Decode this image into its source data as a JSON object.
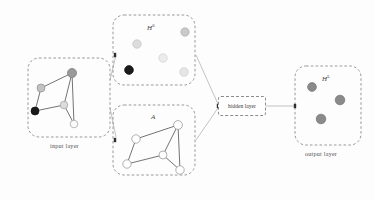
{
  "diagram": {
    "type": "flow-diagram",
    "canvas": {
      "width": 374,
      "height": 200,
      "background": "#fdfdfd"
    }
  },
  "palette": {
    "dashed_border": "#8c8c8c",
    "connector_line": "#b4b4b4",
    "graph_edge": "#5a5a5a",
    "node_black": "#1a1a1a",
    "node_dark_gray": "#9a9a9a",
    "node_mid_gray": "#b9b9b9",
    "node_light_gray": "#d8d8d8",
    "node_white": "#ffffff",
    "node_outline": "#9e9e9e",
    "output_node": "#8a8a8a",
    "text": "#4a4a4a"
  },
  "boxes": {
    "input_layer": {
      "caption": "input layer",
      "x": 28,
      "y": 58,
      "width": 82,
      "height": 79,
      "caption_x": 50,
      "caption_y": 142
    },
    "features": {
      "label": "H",
      "label_sup": "0",
      "x": 113,
      "y": 15,
      "width": 82,
      "height": 70,
      "label_x": 147,
      "label_y": 23
    },
    "adjacency": {
      "label": "A",
      "label_sup": "",
      "x": 113,
      "y": 105,
      "width": 82,
      "height": 70,
      "label_x": 151,
      "label_y": 113
    },
    "hidden_layer": {
      "label": "hidden layer",
      "x": 218,
      "y": 96,
      "width": 48,
      "height": 20
    },
    "output_layer": {
      "label": "H",
      "label_sup": "L",
      "caption": "output layer",
      "x": 295,
      "y": 66,
      "width": 66,
      "height": 79,
      "label_x": 322,
      "label_y": 74,
      "caption_x": 305,
      "caption_y": 150
    }
  },
  "input_graph": {
    "nodes": [
      {
        "id": "n1",
        "cx": 72,
        "cy": 73,
        "r": 4.6,
        "fill": "#9a9a9a",
        "stroke": "#7d7d7d"
      },
      {
        "id": "n2",
        "cx": 41,
        "cy": 88,
        "r": 4.0,
        "fill": "#c2c2c2",
        "stroke": "#8f8f8f"
      },
      {
        "id": "n3",
        "cx": 35,
        "cy": 111,
        "r": 4.0,
        "fill": "#1a1a1a",
        "stroke": "#111111"
      },
      {
        "id": "n4",
        "cx": 64,
        "cy": 105,
        "r": 3.8,
        "fill": "#dcdcdc",
        "stroke": "#9e9e9e"
      },
      {
        "id": "n5",
        "cx": 74,
        "cy": 124,
        "r": 3.8,
        "fill": "#fafafa",
        "stroke": "#9e9e9e"
      }
    ],
    "edges": [
      [
        "n1",
        "n2"
      ],
      [
        "n1",
        "n4"
      ],
      [
        "n1",
        "n5"
      ],
      [
        "n2",
        "n3"
      ],
      [
        "n3",
        "n4"
      ],
      [
        "n4",
        "n5"
      ]
    ]
  },
  "feature_nodes": [
    {
      "id": "f1",
      "cx": 185,
      "cy": 32,
      "r": 4.2,
      "fill": "#c9c9c9",
      "stroke": "#b0b0b0"
    },
    {
      "id": "f2",
      "cx": 137,
      "cy": 44,
      "r": 4.2,
      "fill": "#dddddd",
      "stroke": "#c2c2c2"
    },
    {
      "id": "f3",
      "cx": 163,
      "cy": 58,
      "r": 4.2,
      "fill": "#ececec",
      "stroke": "#cfcfcf"
    },
    {
      "id": "f4",
      "cx": 129,
      "cy": 70,
      "r": 4.4,
      "fill": "#1a1a1a",
      "stroke": "#111111"
    },
    {
      "id": "f5",
      "cx": 184,
      "cy": 72,
      "r": 4.2,
      "fill": "#e6e6e6",
      "stroke": "#cacaca"
    }
  ],
  "adjacency_graph": {
    "nodes": [
      {
        "id": "a1",
        "cx": 178,
        "cy": 125,
        "r": 4.4,
        "fill": "#ffffff",
        "stroke": "#8f8f8f"
      },
      {
        "id": "a2",
        "cx": 136,
        "cy": 139,
        "r": 4.2,
        "fill": "#ffffff",
        "stroke": "#8f8f8f"
      },
      {
        "id": "a3",
        "cx": 127,
        "cy": 164,
        "r": 4.2,
        "fill": "#ffffff",
        "stroke": "#8f8f8f"
      },
      {
        "id": "a4",
        "cx": 163,
        "cy": 155,
        "r": 4.0,
        "fill": "#ffffff",
        "stroke": "#8f8f8f"
      },
      {
        "id": "a5",
        "cx": 180,
        "cy": 170,
        "r": 4.2,
        "fill": "#ffffff",
        "stroke": "#8f8f8f"
      }
    ],
    "edges": [
      [
        "a1",
        "a2"
      ],
      [
        "a1",
        "a4"
      ],
      [
        "a1",
        "a5"
      ],
      [
        "a2",
        "a3"
      ],
      [
        "a3",
        "a4"
      ],
      [
        "a4",
        "a5"
      ]
    ]
  },
  "output_nodes": [
    {
      "id": "o1",
      "cx": 312,
      "cy": 87,
      "r": 4.4,
      "fill": "#8a8a8a",
      "stroke": "#747474"
    },
    {
      "id": "o2",
      "cx": 340,
      "cy": 100,
      "r": 4.8,
      "fill": "#8a8a8a",
      "stroke": "#747474"
    },
    {
      "id": "o3",
      "cx": 321,
      "cy": 119,
      "r": 4.8,
      "fill": "#8a8a8a",
      "stroke": "#747474"
    }
  ],
  "connectors": [
    {
      "id": "input-to-features",
      "x1": 110,
      "y1": 80,
      "x2": 116,
      "y2": 55
    },
    {
      "id": "input-to-adjacency",
      "x1": 110,
      "y1": 108,
      "x2": 116,
      "y2": 137
    },
    {
      "id": "features-to-hidden",
      "x1": 196,
      "y1": 55,
      "x2": 218,
      "y2": 104
    },
    {
      "id": "adjacency-to-hidden",
      "x1": 196,
      "y1": 140,
      "x2": 218,
      "y2": 108
    },
    {
      "id": "hidden-to-output",
      "x1": 266,
      "y1": 106,
      "x2": 295,
      "y2": 106
    }
  ],
  "arrow_marks": [
    {
      "id": "features-inlet",
      "x": 115,
      "y": 55
    },
    {
      "id": "adjacency-inlet",
      "x": 115,
      "y": 140
    },
    {
      "id": "hidden-inlet",
      "x": 218,
      "y": 106
    },
    {
      "id": "output-inlet",
      "x": 295,
      "y": 106
    }
  ]
}
